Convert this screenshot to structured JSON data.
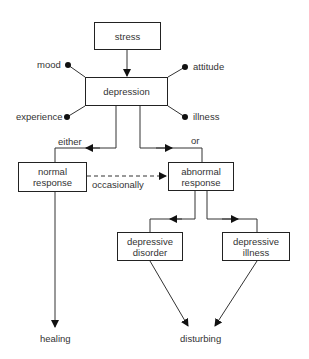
{
  "diagram": {
    "nodes": {
      "stress": "stress",
      "depression": "depression",
      "normal_response_l1": "normal",
      "normal_response_l2": "response",
      "abnormal_response_l1": "abnormal",
      "abnormal_response_l2": "response",
      "depressive_disorder_l1": "depressive",
      "depressive_disorder_l2": "disorder",
      "depressive_illness_l1": "depressive",
      "depressive_illness_l2": "illness"
    },
    "aspects": {
      "mood": "mood",
      "attitude": "attitude",
      "experience": "experience",
      "illness": "illness"
    },
    "edge_labels": {
      "either": "either",
      "or": "or",
      "occasionally": "occasionally"
    },
    "outcomes": {
      "healing": "healing",
      "disturbing": "disturbing"
    }
  }
}
